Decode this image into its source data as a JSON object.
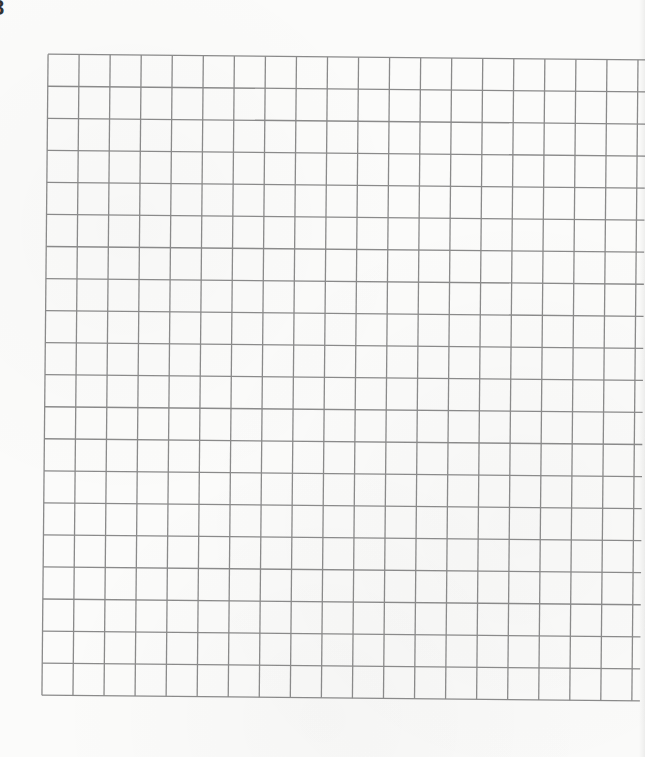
{
  "page": {
    "problem_number": "8",
    "background_color": "#fbfbfa"
  },
  "grid": {
    "columns": 19,
    "rows": 20,
    "cell_width": 31.05,
    "cell_height": 32.05,
    "line_color": "#8a8a8a",
    "line_width": 1.3,
    "rotation_deg": 0.55,
    "overhang_right": 8,
    "contents": []
  }
}
